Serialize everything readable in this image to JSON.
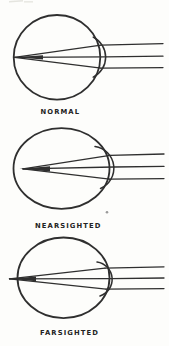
{
  "figure": {
    "colors": {
      "ink": "#2f2f2f",
      "paper": "#fdfdfb",
      "label": "#232323",
      "dot": "#9a9a9a",
      "smudge": "#dcdcd6"
    },
    "panels": [
      {
        "name": "normal",
        "label": "NORMAL"
      },
      {
        "name": "nearsighted",
        "label": "NEARSIGHTED"
      },
      {
        "name": "farsighted",
        "label": "FARSIGHTED"
      }
    ]
  }
}
